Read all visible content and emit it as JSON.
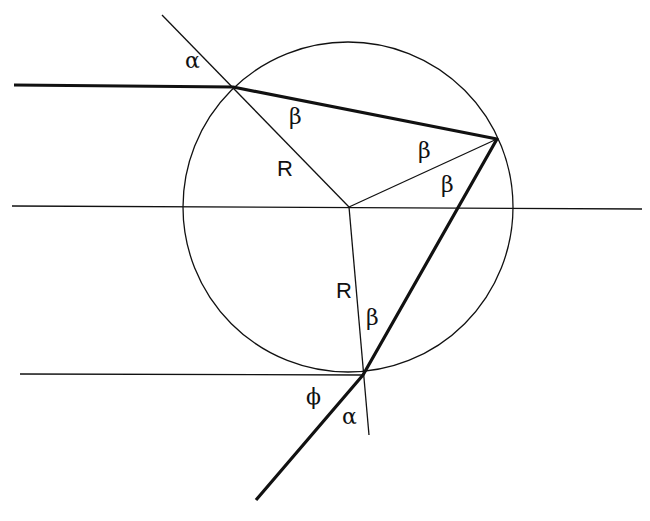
{
  "diagram": {
    "labels": {
      "alpha_top": "α",
      "beta_entry": "β",
      "radius_top": "R",
      "beta_reflect_upper": "β",
      "beta_reflect_lower": "β",
      "radius_bottom": "R",
      "beta_exit": "β",
      "phi": "ϕ",
      "alpha_bottom": "α"
    },
    "colors": {
      "line": "#111111",
      "background": "#ffffff"
    }
  }
}
